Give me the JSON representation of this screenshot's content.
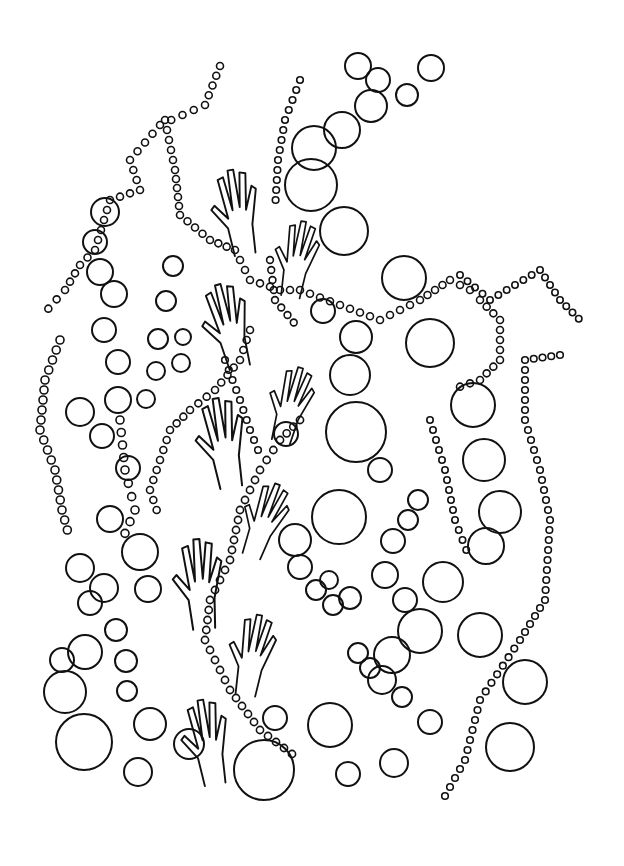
{
  "artwork": {
    "kind": "coloring-page line art",
    "subject": "hands reaching among strings of dots and bubbles",
    "line_color": "#111111",
    "background_color": "#ffffff",
    "hand_count": 8
  }
}
